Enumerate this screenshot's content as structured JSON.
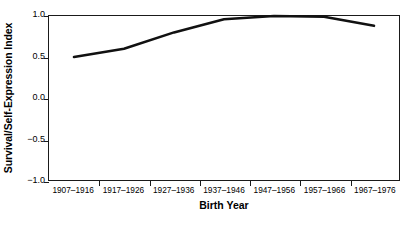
{
  "chart_data": {
    "type": "line",
    "title": "",
    "xlabel": "Birth Year",
    "ylabel": "Survival/Self-Expression Index",
    "categories": [
      "1907-1916",
      "1917-1926",
      "1927-1936",
      "1937-1946",
      "1947-1956",
      "1957-1966",
      "1967-1976"
    ],
    "values": [
      0.5,
      0.6,
      0.8,
      0.96,
      1.0,
      0.99,
      0.88
    ],
    "series": [
      {
        "name": "Survival/Self-Expression Index",
        "values": [
          0.5,
          0.6,
          0.8,
          0.96,
          1.0,
          0.99,
          0.88
        ],
        "color": "#111111",
        "line_width": 2.6
      }
    ],
    "ylim": [
      -1.0,
      1.0
    ],
    "yticks": [
      1.0,
      0.5,
      0.0,
      -0.5,
      -1.0
    ],
    "ytick_labels": [
      "1.0",
      "0.5",
      "0.0",
      "-0.5",
      "-1.0"
    ],
    "grid": false,
    "legend": false,
    "legend_position": "none",
    "frame": "box",
    "background_color": "#ffffff",
    "axis_color": "#1a1a1a"
  }
}
